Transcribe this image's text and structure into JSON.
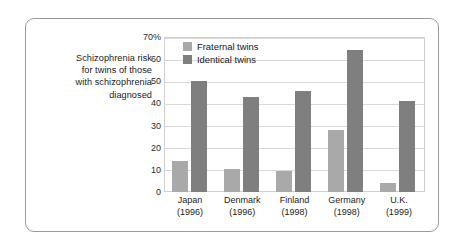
{
  "caption": {
    "lines": [
      "Schizophrenia risk",
      "for twins of those",
      "with schizophrenia",
      "diagnosed"
    ]
  },
  "legend": {
    "position": "inside-top-left",
    "items": [
      {
        "label": "Fraternal twins",
        "color": "#a9a9a9"
      },
      {
        "label": "Identical twins",
        "color": "#7f7f7f"
      }
    ]
  },
  "axis": {
    "y_ticks": [
      "0",
      "10",
      "20",
      "30",
      "40",
      "50",
      "60",
      "70%"
    ],
    "y_tick_values": [
      0,
      10,
      20,
      30,
      40,
      50,
      60,
      70
    ]
  },
  "chart_data": {
    "type": "bar",
    "title": "Schizophrenia risk for twins of those with schizophrenia diagnosed",
    "xlabel": "",
    "ylabel": "",
    "ylim": [
      0,
      70
    ],
    "ytick_values": [
      0,
      10,
      20,
      30,
      40,
      50,
      60,
      70
    ],
    "ytick_labels": [
      "0",
      "10",
      "20",
      "30",
      "40",
      "50",
      "60",
      "70%"
    ],
    "grid": true,
    "grid_axis": "y",
    "legend_position": "inside-top-left",
    "units": "percent",
    "categories": [
      "Japan\n(1996)",
      "Denmark\n(1996)",
      "Finland\n(1998)",
      "Germany\n(1998)",
      "U.K.\n(1999)"
    ],
    "category_names": [
      "Japan",
      "Denmark",
      "Finland",
      "Germany",
      "U.K."
    ],
    "category_years": [
      "(1996)",
      "(1996)",
      "(1998)",
      "(1998)",
      "(1999)"
    ],
    "series": [
      {
        "name": "Fraternal twins",
        "color": "#a9a9a9",
        "values": [
          14,
          10.5,
          9.5,
          28,
          4
        ]
      },
      {
        "name": "Identical twins",
        "color": "#7f7f7f",
        "values": [
          50,
          43,
          45.5,
          64,
          41
        ]
      }
    ]
  }
}
